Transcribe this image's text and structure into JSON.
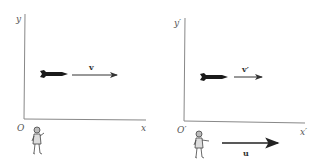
{
  "diagram": {
    "frames": [
      {
        "id": "S",
        "axis_labels": {
          "y": "y",
          "x": "x",
          "origin": "O"
        },
        "rocket_velocity_label": "v",
        "observer": "stationary observer"
      },
      {
        "id": "S-prime",
        "axis_labels": {
          "y": "y′",
          "x": "x′",
          "origin": "O′"
        },
        "rocket_velocity_label": "v′",
        "observer": "moving observer",
        "frame_velocity_label": "u"
      }
    ],
    "colors": {
      "axis": "#888888",
      "arrow": "#333333",
      "rocket": "#1a1a1a",
      "label": "#555555"
    }
  }
}
